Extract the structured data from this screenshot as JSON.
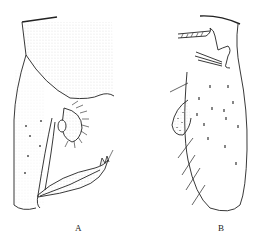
{
  "figure": {
    "panels": [
      {
        "id": "A",
        "label": "A",
        "description": "lateral view, stippled, with setose lobe and pointed process"
      },
      {
        "id": "B",
        "label": "B",
        "description": "elongate lobe with scattered short setae, marginal long setae, small stippled lobe"
      }
    ],
    "colors": {
      "ink": "#222222",
      "background": "#ffffff",
      "stipple": "#9a9a9a"
    }
  }
}
